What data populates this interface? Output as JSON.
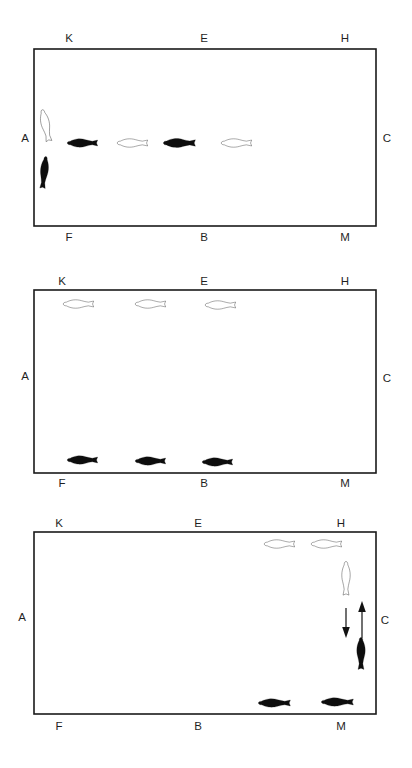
{
  "figure": {
    "panel_count": 3,
    "colors": {
      "background": "#ffffff",
      "border": "#1a1a1a",
      "fish_dark": "#0d0d0d",
      "fish_light_fill": "#ffffff",
      "fish_light_stroke": "#1a1a1a",
      "label_text": "#1f1f1f",
      "arrow": "#111111"
    },
    "panels": [
      {
        "id": "panel-a",
        "index": 1,
        "rect": {
          "x": 34,
          "y": 49,
          "width": 342,
          "height": 177
        },
        "labels": [
          {
            "name": "corner-label-k",
            "text": "K",
            "x": 69,
            "y": 42,
            "anchor": "middle"
          },
          {
            "name": "corner-label-e",
            "text": "E",
            "x": 204,
            "y": 42,
            "anchor": "middle"
          },
          {
            "name": "corner-label-h",
            "text": "H",
            "x": 345,
            "y": 42,
            "anchor": "middle"
          },
          {
            "name": "corner-label-a",
            "text": "A",
            "x": 25,
            "y": 142,
            "anchor": "middle"
          },
          {
            "name": "corner-label-c",
            "text": "C",
            "x": 387,
            "y": 142,
            "anchor": "middle"
          },
          {
            "name": "corner-label-f",
            "text": "F",
            "x": 69,
            "y": 241,
            "anchor": "middle"
          },
          {
            "name": "corner-label-b",
            "text": "B",
            "x": 204,
            "y": 241,
            "anchor": "middle"
          },
          {
            "name": "corner-label-m",
            "text": "M",
            "x": 345,
            "y": 241,
            "anchor": "middle"
          }
        ],
        "fish": [
          {
            "name": "fish-light-vertical-upper-left",
            "shade": "light",
            "orientation": "vertical",
            "facing": "up",
            "cx": 46,
            "cy": 127,
            "length": 40,
            "width": 14,
            "rotate": -12
          },
          {
            "name": "fish-dark-vertical-lower-left",
            "shade": "dark",
            "orientation": "vertical",
            "facing": "down",
            "cx": 44,
            "cy": 174,
            "length": 40,
            "width": 13,
            "rotate": 6
          },
          {
            "name": "fish-dark-horizontal-1",
            "shade": "dark",
            "orientation": "horizontal",
            "facing": "left",
            "cx": 84,
            "cy": 143,
            "length": 38,
            "width": 14,
            "rotate": 0
          },
          {
            "name": "fish-light-horizontal-1",
            "shade": "light",
            "orientation": "horizontal",
            "facing": "left",
            "cx": 134,
            "cy": 143,
            "length": 38,
            "width": 14,
            "rotate": 0
          },
          {
            "name": "fish-dark-horizontal-2",
            "shade": "dark",
            "orientation": "horizontal",
            "facing": "left",
            "cx": 181,
            "cy": 143,
            "length": 40,
            "width": 15,
            "rotate": 0
          },
          {
            "name": "fish-light-horizontal-2",
            "shade": "light",
            "orientation": "horizontal",
            "facing": "left",
            "cx": 238,
            "cy": 143,
            "length": 38,
            "width": 14,
            "rotate": 0
          }
        ],
        "arrows": []
      },
      {
        "id": "panel-b",
        "index": 2,
        "rect": {
          "x": 34,
          "y": 290,
          "width": 342,
          "height": 183
        },
        "labels": [
          {
            "name": "corner-label-k",
            "text": "K",
            "x": 62,
            "y": 285,
            "anchor": "middle"
          },
          {
            "name": "corner-label-e",
            "text": "E",
            "x": 204,
            "y": 285,
            "anchor": "middle"
          },
          {
            "name": "corner-label-h",
            "text": "H",
            "x": 345,
            "y": 285,
            "anchor": "middle"
          },
          {
            "name": "corner-label-a",
            "text": "A",
            "x": 25,
            "y": 380,
            "anchor": "middle"
          },
          {
            "name": "corner-label-c",
            "text": "C",
            "x": 387,
            "y": 382,
            "anchor": "middle"
          },
          {
            "name": "corner-label-f",
            "text": "F",
            "x": 62,
            "y": 487,
            "anchor": "middle"
          },
          {
            "name": "corner-label-b",
            "text": "B",
            "x": 204,
            "y": 487,
            "anchor": "middle"
          },
          {
            "name": "corner-label-m",
            "text": "M",
            "x": 345,
            "y": 487,
            "anchor": "middle"
          }
        ],
        "fish": [
          {
            "name": "fish-light-top-1",
            "shade": "light",
            "orientation": "horizontal",
            "facing": "left",
            "cx": 80,
            "cy": 304,
            "length": 38,
            "width": 14,
            "rotate": 0
          },
          {
            "name": "fish-light-top-2",
            "shade": "light",
            "orientation": "horizontal",
            "facing": "left",
            "cx": 152,
            "cy": 304,
            "length": 38,
            "width": 14,
            "rotate": 0
          },
          {
            "name": "fish-light-top-3",
            "shade": "light",
            "orientation": "horizontal",
            "facing": "left",
            "cx": 222,
            "cy": 305,
            "length": 38,
            "width": 14,
            "rotate": 0
          },
          {
            "name": "fish-dark-bottom-1",
            "shade": "dark",
            "orientation": "horizontal",
            "facing": "left",
            "cx": 84,
            "cy": 460,
            "length": 38,
            "width": 14,
            "rotate": 0
          },
          {
            "name": "fish-dark-bottom-2",
            "shade": "dark",
            "orientation": "horizontal",
            "facing": "left",
            "cx": 152,
            "cy": 461,
            "length": 38,
            "width": 14,
            "rotate": 0
          },
          {
            "name": "fish-dark-bottom-3",
            "shade": "dark",
            "orientation": "horizontal",
            "facing": "left",
            "cx": 219,
            "cy": 462,
            "length": 38,
            "width": 14,
            "rotate": 0
          }
        ],
        "arrows": []
      },
      {
        "id": "panel-c",
        "index": 3,
        "rect": {
          "x": 34,
          "y": 532,
          "width": 342,
          "height": 182
        },
        "labels": [
          {
            "name": "corner-label-k",
            "text": "K",
            "x": 59,
            "y": 527,
            "anchor": "middle"
          },
          {
            "name": "corner-label-e",
            "text": "E",
            "x": 198,
            "y": 527,
            "anchor": "middle"
          },
          {
            "name": "corner-label-h",
            "text": "H",
            "x": 341,
            "y": 527,
            "anchor": "middle"
          },
          {
            "name": "corner-label-a",
            "text": "A",
            "x": 22,
            "y": 621,
            "anchor": "middle"
          },
          {
            "name": "corner-label-c",
            "text": "C",
            "x": 385,
            "y": 624,
            "anchor": "middle"
          },
          {
            "name": "corner-label-f",
            "text": "F",
            "x": 59,
            "y": 730,
            "anchor": "middle"
          },
          {
            "name": "corner-label-b",
            "text": "B",
            "x": 198,
            "y": 730,
            "anchor": "middle"
          },
          {
            "name": "corner-label-m",
            "text": "M",
            "x": 341,
            "y": 730,
            "anchor": "middle"
          }
        ],
        "fish": [
          {
            "name": "fish-light-top-1",
            "shade": "light",
            "orientation": "horizontal",
            "facing": "left",
            "cx": 281,
            "cy": 544,
            "length": 38,
            "width": 14,
            "rotate": 0
          },
          {
            "name": "fish-light-top-2",
            "shade": "light",
            "orientation": "horizontal",
            "facing": "left",
            "cx": 328,
            "cy": 544,
            "length": 38,
            "width": 14,
            "rotate": 0
          },
          {
            "name": "fish-light-vertical",
            "shade": "light",
            "orientation": "vertical",
            "facing": "up",
            "cx": 346,
            "cy": 580,
            "length": 42,
            "width": 14,
            "rotate": 0
          },
          {
            "name": "fish-dark-vertical",
            "shade": "dark",
            "orientation": "vertical",
            "facing": "up",
            "cx": 361,
            "cy": 655,
            "length": 40,
            "width": 14,
            "rotate": 0
          },
          {
            "name": "fish-dark-bottom-1",
            "shade": "dark",
            "orientation": "horizontal",
            "facing": "left",
            "cx": 276,
            "cy": 703,
            "length": 40,
            "width": 14,
            "rotate": 0
          },
          {
            "name": "fish-dark-bottom-2",
            "shade": "dark",
            "orientation": "horizontal",
            "facing": "left",
            "cx": 339,
            "cy": 702,
            "length": 40,
            "width": 14,
            "rotate": 0
          }
        ],
        "arrows": [
          {
            "name": "arrow-down",
            "direction": "down",
            "x": 346,
            "y1": 608,
            "y2": 638
          },
          {
            "name": "arrow-up",
            "direction": "up",
            "x": 362,
            "y1": 638,
            "y2": 601
          }
        ]
      }
    ]
  }
}
